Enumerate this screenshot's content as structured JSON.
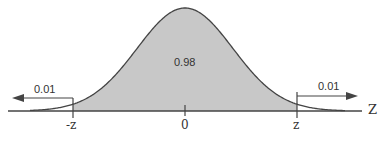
{
  "diagram": {
    "type": "normal-distribution",
    "center_area": "0.98",
    "left_tail_area": "0.01",
    "right_tail_area": "0.01",
    "tick_labels": [
      "-z",
      "0",
      "z"
    ],
    "axis_label": "Z",
    "colors": {
      "fill": "#c8c8c8",
      "stroke": "#444444",
      "background": "#ffffff"
    }
  }
}
